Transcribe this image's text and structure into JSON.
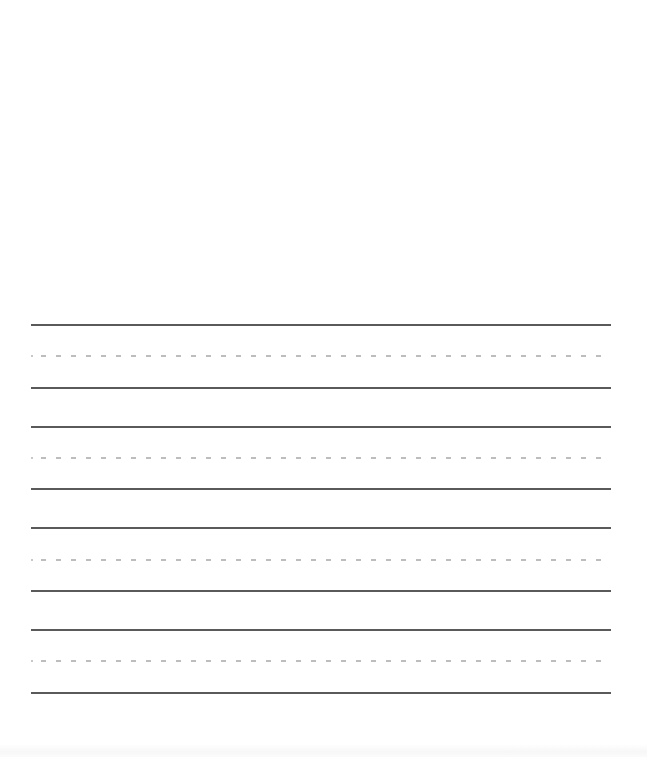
{
  "page": {
    "type": "handwriting-practice-sheet",
    "background_color": "#ffffff",
    "solid_line_color": "#5a5a5a",
    "dashed_line_color": "#bdbdbd",
    "line_left": 31,
    "line_width": 580,
    "line_groups": [
      {
        "top_solid_y": 324,
        "mid_dashed_y": 355,
        "bottom_solid_y": 387
      },
      {
        "top_solid_y": 426,
        "mid_dashed_y": 457,
        "bottom_solid_y": 488
      },
      {
        "top_solid_y": 527,
        "mid_dashed_y": 559,
        "bottom_solid_y": 590
      },
      {
        "top_solid_y": 629,
        "mid_dashed_y": 660,
        "bottom_solid_y": 692
      }
    ]
  }
}
